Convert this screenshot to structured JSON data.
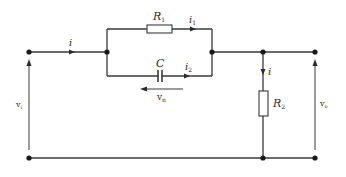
{
  "diagram": {
    "type": "circuit",
    "labels": {
      "input_current": "i",
      "r1": "R",
      "r1_sub": "1",
      "i1": "i",
      "i1_sub": "1",
      "capacitor": "C",
      "i2": "i",
      "i2_sub": "2",
      "vn": "v",
      "vn_sub": "n",
      "r2": "R",
      "r2_sub": "2",
      "r2_current": "i",
      "vi": "v",
      "vi_sub": "i",
      "vo": "v",
      "vo_sub": "o"
    },
    "components": [
      {
        "id": "R1",
        "kind": "resistor",
        "branch": "parallel-top"
      },
      {
        "id": "C",
        "kind": "capacitor",
        "branch": "parallel-bottom"
      },
      {
        "id": "R2",
        "kind": "resistor",
        "branch": "shunt"
      }
    ],
    "colors": {
      "wire": "#3a3a3a",
      "node": "#1a1a1a",
      "background": "#ffffff"
    }
  }
}
